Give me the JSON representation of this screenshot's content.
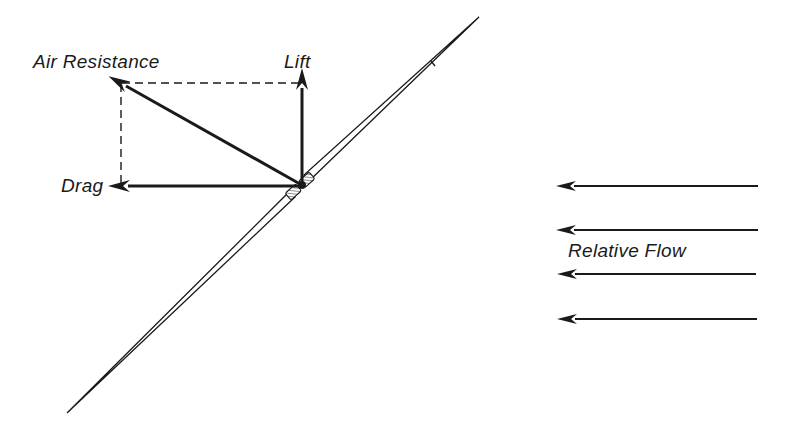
{
  "diagram": {
    "colors": {
      "ink": "#1a1a1a",
      "background": "#ffffff"
    },
    "labels": {
      "air_resistance": "Air Resistance",
      "lift": "Lift",
      "drag": "Drag",
      "relative_flow": "Relative Flow"
    },
    "vectors": [
      {
        "name": "Air Resistance",
        "from": [
          302,
          185
        ],
        "to": [
          122,
          84
        ],
        "style": "solid-arrow"
      },
      {
        "name": "Lift",
        "from": [
          302,
          185
        ],
        "to": [
          302,
          80
        ],
        "style": "solid-arrow"
      },
      {
        "name": "Drag",
        "from": [
          302,
          185
        ],
        "to": [
          122,
          186
        ],
        "style": "solid-arrow"
      }
    ],
    "construction_lines": [
      {
        "from": [
          122,
          83
        ],
        "to": [
          302,
          83
        ],
        "style": "dashed"
      },
      {
        "from": [
          121,
          83
        ],
        "to": [
          121,
          186
        ],
        "style": "dashed"
      }
    ],
    "flow_arrows": [
      {
        "y": 186,
        "x_start": 758,
        "x_end": 568
      },
      {
        "y": 230,
        "x_start": 758,
        "x_end": 568
      },
      {
        "y": 274,
        "x_start": 756,
        "x_end": 569
      },
      {
        "y": 319,
        "x_start": 757,
        "x_end": 569
      }
    ],
    "javelin": {
      "tail_tip": [
        67,
        413
      ],
      "head_tip": [
        479,
        17
      ],
      "grip_center": [
        300,
        186
      ]
    }
  }
}
